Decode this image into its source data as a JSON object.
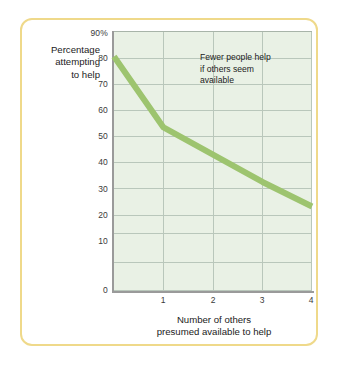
{
  "figure": {
    "frame_color": "#efd98a",
    "background_color": "#ffffff"
  },
  "chart_data": {
    "type": "line",
    "title": "",
    "subtitle": "",
    "xlabel": "Number of others presumed available to help",
    "xlabel_lines": [
      "Number of others",
      "presumed available to help"
    ],
    "ylabel": "Percentage attempting to help",
    "ylabel_lines": [
      "Percentage",
      "attempting",
      "to help"
    ],
    "x": [
      0,
      1,
      2,
      3,
      4
    ],
    "values": [
      86,
      60,
      50,
      40,
      31
    ],
    "series": [
      {
        "name": "Percentage attempting to help",
        "color": "#9dc46f",
        "values": [
          86,
          60,
          50,
          40,
          31
        ]
      }
    ],
    "xlim": [
      0,
      4
    ],
    "ylim": [
      0,
      95
    ],
    "xticks": [
      1,
      2,
      3,
      4
    ],
    "xtick_labels": [
      "1",
      "2",
      "3",
      "4"
    ],
    "yticks": [
      0,
      10,
      20,
      30,
      40,
      50,
      60,
      70,
      80,
      90
    ],
    "ytick_labels": [
      "0",
      "10",
      "20",
      "30",
      "40",
      "50",
      "60",
      "70",
      "80",
      "90%"
    ],
    "grid": true,
    "grid_color": "#b9c7bb",
    "plot_background": "#e9f1e5",
    "axis_color": "#9a9a9a",
    "legend": "none",
    "annotations": [
      {
        "text": "Fewer people help if others seem available",
        "lines": [
          "Fewer people help",
          "if others seem",
          "available"
        ],
        "x": 2.0,
        "y": 83
      }
    ]
  }
}
